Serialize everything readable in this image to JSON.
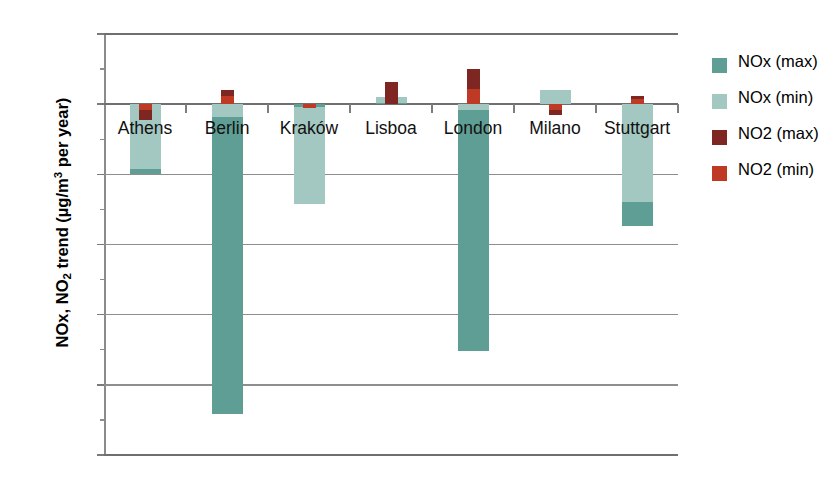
{
  "chart_data": {
    "type": "bar",
    "title": "",
    "subtitle": "",
    "xlabel": "",
    "ylabel": "NOx, NO2 trend (µg/m3 per year)",
    "ylabel_parts": {
      "prefix": "NOx, NO",
      "sub1": "2",
      "mid": " trend (µg/m",
      "sup1": "3",
      "suffix": " per year)"
    },
    "ylim": [
      -25,
      5
    ],
    "yticks": [
      5,
      0,
      -5,
      -10,
      -15,
      -20,
      -25
    ],
    "ytick_labels": [
      "5",
      "0",
      "-5",
      "-10",
      "-15",
      "-20",
      "-25"
    ],
    "grid": true,
    "grid_axis": "y",
    "legend_position": "right",
    "categories": [
      "Athens",
      "Berlin",
      "Kraków",
      "Lisboa",
      "London",
      "Milano",
      "Stuttgart"
    ],
    "series": [
      {
        "name": "NOx (max)",
        "color": "#5f9e94",
        "values": [
          -5.0,
          -22.1,
          -0.2,
          0.1,
          -17.6,
          0.0,
          -8.7
        ]
      },
      {
        "name": "NOx (min)",
        "color": "#a3c8c1",
        "values": [
          -4.6,
          -0.9,
          -7.1,
          0.5,
          -0.4,
          1.0,
          -7.0
        ]
      },
      {
        "name": "NO2 (max)",
        "color": "#7d2622",
        "values": [
          -1.1,
          1.0,
          -0.3,
          1.6,
          2.5,
          -0.8,
          0.6
        ]
      },
      {
        "name": "NO2 (min)",
        "color": "#bf3a25",
        "values": [
          -0.45,
          0.55,
          -0.28,
          0.0,
          1.1,
          -0.4,
          0.35
        ]
      }
    ]
  },
  "legend": {
    "items": [
      {
        "label": "NOx (max)",
        "color": "#5f9e94"
      },
      {
        "label": "NOx (min)",
        "color": "#a3c8c1"
      },
      {
        "label": "NO2 (max)",
        "color": "#7d2622"
      },
      {
        "label": "NO2 (min)",
        "color": "#bf3a25"
      }
    ]
  },
  "axis": {
    "y_labels": [
      "5",
      "0",
      "-5",
      "-10",
      "-15",
      "-20",
      "-25"
    ]
  }
}
